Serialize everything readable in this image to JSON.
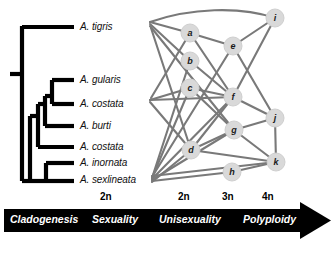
{
  "figure": {
    "background": "#ffffff",
    "line_color": "#6e6e6e",
    "tree_color": "#000000",
    "node_fill": "#d9d9d9",
    "bar_color": "#000000",
    "bar_text_color": "#ffffff"
  },
  "cladogram": {
    "taxa": [
      {
        "id": "tigris",
        "label": "A. tigris",
        "x": 80,
        "y": 27,
        "tip_x": 74
      },
      {
        "id": "gularis",
        "label": "A. gularis",
        "x": 80,
        "y": 80,
        "tip_x": 74
      },
      {
        "id": "costata1",
        "label": "A. costata",
        "x": 80,
        "y": 104,
        "tip_x": 74
      },
      {
        "id": "burti",
        "label": "A. burti",
        "x": 80,
        "y": 126,
        "tip_x": 74
      },
      {
        "id": "costata2",
        "label": "A. costata",
        "x": 80,
        "y": 147,
        "tip_x": 74
      },
      {
        "id": "inornata",
        "label": "A. inornata",
        "x": 80,
        "y": 163,
        "tip_x": 74
      },
      {
        "id": "sexlineata",
        "label": "A. sexlineata",
        "x": 80,
        "y": 180,
        "tip_x": 74
      }
    ]
  },
  "network": {
    "nodes": [
      {
        "id": "a",
        "label": "a",
        "cx": 190,
        "cy": 33,
        "r": 9
      },
      {
        "id": "b",
        "label": "b",
        "cx": 190,
        "cy": 61,
        "r": 9
      },
      {
        "id": "c",
        "label": "c",
        "cx": 190,
        "cy": 88,
        "r": 9
      },
      {
        "id": "d",
        "label": "d",
        "cx": 191,
        "cy": 150,
        "r": 9
      },
      {
        "id": "e",
        "label": "e",
        "cx": 233,
        "cy": 46,
        "r": 9
      },
      {
        "id": "f",
        "label": "f",
        "cx": 233,
        "cy": 97,
        "r": 9
      },
      {
        "id": "g",
        "label": "g",
        "cx": 234,
        "cy": 130,
        "r": 9
      },
      {
        "id": "h",
        "label": "h",
        "cx": 232,
        "cy": 172,
        "r": 9
      },
      {
        "id": "i",
        "label": "i",
        "cx": 275,
        "cy": 18,
        "r": 9
      },
      {
        "id": "j",
        "label": "j",
        "cx": 275,
        "cy": 118,
        "r": 9
      },
      {
        "id": "k",
        "label": "k",
        "cx": 276,
        "cy": 162,
        "r": 9
      }
    ],
    "anchors": [
      {
        "id": "anchor-tigris",
        "x": 150,
        "y": 22
      },
      {
        "id": "anchor-costata",
        "x": 150,
        "y": 100
      },
      {
        "id": "anchor-sexlineata",
        "x": 152,
        "y": 178
      }
    ]
  },
  "axis": {
    "ploidy_labels": [
      {
        "text": "2n",
        "x": 100,
        "y": 192
      },
      {
        "text": "2n",
        "x": 178,
        "y": 192
      },
      {
        "text": "3n",
        "x": 222,
        "y": 192
      },
      {
        "text": "4n",
        "x": 262,
        "y": 192
      }
    ],
    "stages": [
      {
        "text": "Cladogenesis",
        "x": 10,
        "y": 214
      },
      {
        "text": "Sexuality",
        "x": 90,
        "y": 214
      },
      {
        "text": "Unisexuality",
        "x": 158,
        "y": 214
      },
      {
        "text": "Polyploidy",
        "x": 243,
        "y": 214
      }
    ],
    "bar": {
      "x": 4,
      "y": 209,
      "width": 296,
      "height": 23
    },
    "arrow_tip_x": 331
  }
}
